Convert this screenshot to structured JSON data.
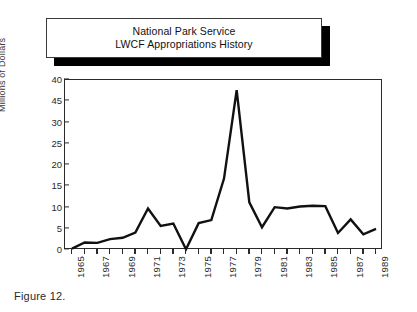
{
  "figure": {
    "caption": "Figure 12."
  },
  "title_box": {
    "line1": "National Park Service",
    "line2": "LWCF Appropriations History"
  },
  "chart_data": {
    "type": "line",
    "title": "National Park Service LWCF Appropriations History",
    "xlabel": "",
    "ylabel": "Millions of Dollars",
    "grid": false,
    "legend": false,
    "ylim": [
      0,
      50
    ],
    "y_tick_labels": [
      "40",
      "45",
      "30",
      "25",
      "20",
      "15",
      "10",
      "5",
      "0"
    ],
    "y_tick_values": [
      50,
      45,
      40,
      35,
      30,
      25,
      20,
      15,
      10,
      5,
      0
    ],
    "x_tick_labels": [
      "1965",
      "1967",
      "1969",
      "1971",
      "1973",
      "1975",
      "1977",
      "1979",
      "1981",
      "1983",
      "1985",
      "1987",
      "1989"
    ],
    "x": [
      1965,
      1966,
      1967,
      1968,
      1969,
      1970,
      1971,
      1972,
      1973,
      1974,
      1975,
      1976,
      1977,
      1978,
      1979,
      1980,
      1981,
      1982,
      1983,
      1984,
      1985,
      1986,
      1987,
      1988,
      1989
    ],
    "values": [
      0.4,
      2.2,
      2.1,
      3.2,
      3.6,
      5.1,
      12.2,
      7.1,
      7.8,
      0.2,
      7.9,
      8.8,
      21.0,
      47.0,
      14.0,
      6.7,
      12.6,
      12.2,
      12.8,
      13.0,
      12.9,
      5.0,
      9.0,
      4.6,
      6.2
    ],
    "peak": {
      "year": 1978,
      "value": 47.0
    },
    "secondary_peak": {
      "year": 1971,
      "value": 12.2
    },
    "trough": {
      "year": 1974,
      "value": 0.2
    }
  }
}
